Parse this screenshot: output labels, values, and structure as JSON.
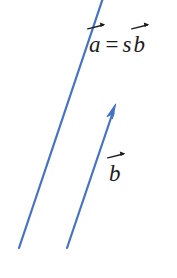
{
  "figure": {
    "background_color": "#ffffff",
    "stroke_color": "#4472c4",
    "text_color": "#1c1c1c",
    "equation": {
      "full_text": "a = s b",
      "vector_a_letter": "a",
      "equals_sign": "=",
      "scalar_letter": "s",
      "vector_b_letter": "b"
    },
    "vector_b_label": {
      "letter": "b"
    }
  },
  "chart_data": {
    "type": "diagram",
    "title": "",
    "xlabel": "",
    "ylabel": "",
    "xlim": [
      0,
      177
    ],
    "ylim": [
      0,
      278
    ],
    "grid": false,
    "legend": "none",
    "annotations": [
      {
        "name": "equation",
        "text": "a = s b",
        "x": 88,
        "y": 33
      },
      {
        "name": "vector-b-label",
        "text": "b",
        "x": 108,
        "y": 162
      }
    ],
    "series": [
      {
        "name": "vector-a-line",
        "type": "segment",
        "arrowhead": false,
        "color": "#4472c4",
        "linewidth": 2.2,
        "x": [
          103,
          19
        ],
        "y": [
          0,
          248
        ]
      },
      {
        "name": "vector-b-arrow",
        "type": "segment",
        "arrowhead": true,
        "color": "#4472c4",
        "linewidth": 2.2,
        "x": [
          67,
          115
        ],
        "y": [
          248,
          106
        ]
      }
    ]
  }
}
